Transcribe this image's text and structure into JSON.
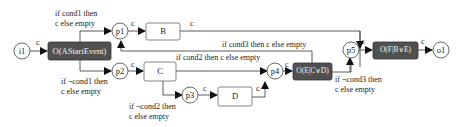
{
  "diagram": {
    "nodes": {
      "i1": {
        "label": "i1",
        "type": "place"
      },
      "start": {
        "label": "O(AStartEvent)",
        "type": "operation"
      },
      "p1": {
        "label": "p1",
        "type": "place"
      },
      "p2": {
        "label": "p2",
        "type": "place"
      },
      "p3": {
        "label": "p3",
        "type": "place"
      },
      "p4": {
        "label": "p4",
        "type": "place"
      },
      "p5": {
        "label": "p5",
        "type": "place"
      },
      "B": {
        "label": "B",
        "type": "task"
      },
      "C": {
        "label": "C",
        "type": "task"
      },
      "D": {
        "label": "D",
        "type": "task"
      },
      "E": {
        "label": "O(E|C∨D)",
        "type": "operation"
      },
      "F": {
        "label": "O(F|B∨E)",
        "type": "operation"
      },
      "o1": {
        "label": "o1",
        "type": "place"
      }
    },
    "edge_labels": {
      "c": "c",
      "cond1": [
        "if cond1 then",
        "c else empty"
      ],
      "not_cond1": [
        "if ¬cond1 then",
        "c else empty"
      ],
      "cond2": "if cond2 then c else empty",
      "not_cond2": [
        "if ¬cond2 then",
        "c else empty"
      ],
      "cond3": "if cond3 then c else empty",
      "not_cond3": [
        "if ¬cond3 then",
        "c else empty"
      ]
    },
    "colors": {
      "operation_fill": "#505050",
      "stroke": "#333333",
      "task_stroke": "#666666"
    }
  }
}
